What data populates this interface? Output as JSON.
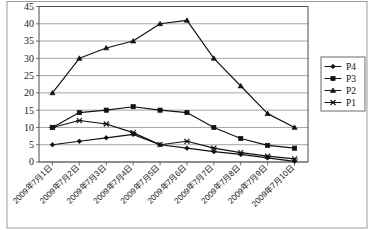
{
  "chart_data": {
    "type": "line",
    "title": "",
    "xlabel": "",
    "ylabel": "",
    "ylim": [
      0,
      45
    ],
    "ytick_step": 5,
    "yticks": [
      0,
      5,
      10,
      15,
      20,
      25,
      30,
      35,
      40,
      45
    ],
    "grid": true,
    "legend_position": "right",
    "categories": [
      "2009年7月1日",
      "2009年7月2日",
      "2009年7月3日",
      "2009年7月4日",
      "2009年7月5日",
      "2009年7月6日",
      "2009年7月7日",
      "2009年7月8日",
      "2009年7月9日",
      "2009年7月10日"
    ],
    "series": [
      {
        "name": "P4",
        "marker": "diamond",
        "values": [
          5,
          6,
          7,
          8,
          5,
          4,
          3,
          2.2,
          1.2,
          0.2
        ]
      },
      {
        "name": "P3",
        "marker": "square",
        "values": [
          10,
          14.3,
          15,
          16,
          15,
          14.3,
          10,
          6.8,
          4.8,
          4
        ]
      },
      {
        "name": "P2",
        "marker": "triangle",
        "values": [
          20,
          30,
          33,
          35,
          40,
          41,
          30,
          22,
          14,
          10
        ]
      },
      {
        "name": "P1",
        "marker": "cross",
        "values": [
          10,
          12,
          11,
          8.5,
          5,
          6,
          4,
          2.7,
          1.7,
          0.9
        ]
      }
    ]
  },
  "legend": {
    "entries": [
      {
        "label": "P4"
      },
      {
        "label": "P3"
      },
      {
        "label": "P2"
      },
      {
        "label": "P1"
      }
    ]
  },
  "colors": {
    "series": "#111111",
    "grid": "#7d7d7d",
    "frame": "#4a4a4a",
    "background": "#ffffff"
  }
}
